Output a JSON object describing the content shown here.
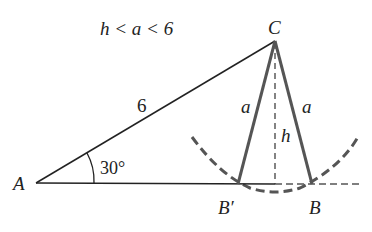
{
  "figure": {
    "condition": "h < a < 6",
    "points": {
      "A": {
        "label": "A",
        "x": 36,
        "y": 183
      },
      "C": {
        "label": "C",
        "x": 275,
        "y": 41
      },
      "B_prime": {
        "label": "B′",
        "x": 238,
        "y": 184
      },
      "B": {
        "label": "B",
        "x": 312,
        "y": 184
      },
      "foot": {
        "x": 275,
        "y": 184
      }
    },
    "side_labels": {
      "AC": "6",
      "CB_prime": "a",
      "CB": "a",
      "height": "h"
    },
    "angle_label": "30°",
    "colors": {
      "line": "#222222",
      "side_a": "#555555",
      "dashed": "#555555"
    }
  }
}
